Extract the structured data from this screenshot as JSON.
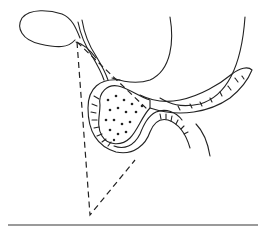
{
  "figure": {
    "type": "anatomical line illustration",
    "structures": [
      {
        "id": "gallbladder",
        "label": "Gallbladder"
      },
      {
        "id": "bile-duct",
        "label": "Bile duct"
      },
      {
        "id": "stomach-outline",
        "label": "Stomach"
      },
      {
        "id": "duodenum",
        "label": "Duodenum"
      },
      {
        "id": "pancreas-head",
        "label": "Pancreas head"
      },
      {
        "id": "pancreas-tail",
        "label": "Pancreas tail"
      },
      {
        "id": "dashed-triangle",
        "label": "Dashed triangle"
      }
    ],
    "colors": {
      "ink": "#222222",
      "rule": "#9a9a9a",
      "background": "#ffffff"
    }
  },
  "caption": {
    "text": ""
  }
}
